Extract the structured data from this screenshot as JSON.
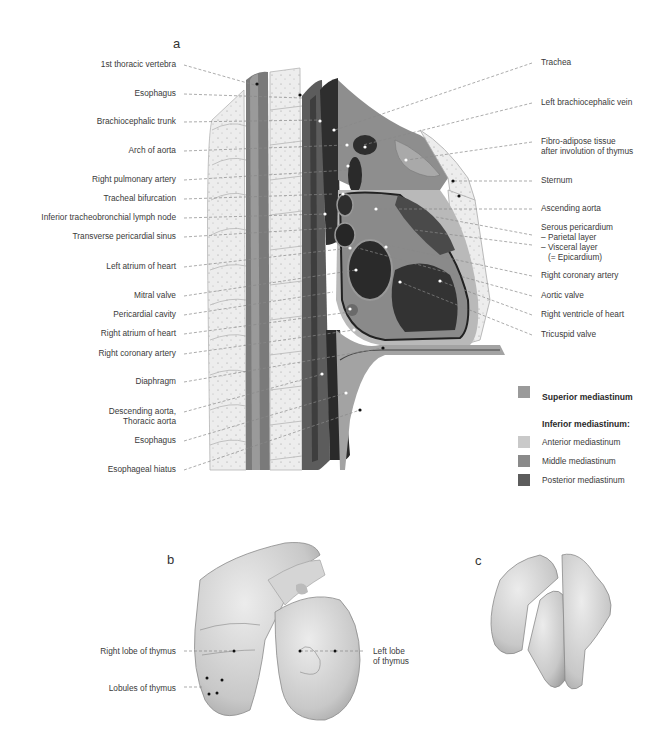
{
  "figure": {
    "panel_a_letter": "a",
    "panel_b_letter": "b",
    "panel_c_letter": "c"
  },
  "panel_a": {
    "left_labels": [
      {
        "text": "1st thoracic vertebra",
        "y": 62
      },
      {
        "text": "Esophagus",
        "y": 91
      },
      {
        "text": "Brachiocephalic trunk",
        "y": 119
      },
      {
        "text": "Arch of aorta",
        "y": 148
      },
      {
        "text": "Right pulmonary artery",
        "y": 177
      },
      {
        "text": "Tracheal bifurcation",
        "y": 196
      },
      {
        "text": "Inferior tracheobronchial lymph node",
        "y": 215
      },
      {
        "text": "Transverse pericardial sinus",
        "y": 234
      },
      {
        "text": "Left atrium of heart",
        "y": 264
      },
      {
        "text": "Mitral valve",
        "y": 293
      },
      {
        "text": "Pericardial cavity",
        "y": 312
      },
      {
        "text": "Right atrium of heart",
        "y": 331
      },
      {
        "text": "Right coronary artery",
        "y": 351
      },
      {
        "text": "Diaphragm",
        "y": 379
      },
      {
        "text": "Descending aorta,\nThoracic aorta",
        "y": 409
      },
      {
        "text": "Esophagus",
        "y": 438
      },
      {
        "text": "Esophageal hiatus",
        "y": 467
      }
    ],
    "right_labels": [
      {
        "text": "Trachea",
        "y": 60
      },
      {
        "text": "Left brachiocephalic vein",
        "y": 100
      },
      {
        "text": "Fibro-adipose tissue\nafter involution of thymus",
        "y": 139
      },
      {
        "text": "Sternum",
        "y": 178
      },
      {
        "text": "Ascending aorta",
        "y": 206
      },
      {
        "text": "Serous pericardium\n– Parietal layer\n– Visceral layer\n   (= Epicardium)",
        "y": 225
      },
      {
        "text": "Right coronary artery",
        "y": 273
      },
      {
        "text": "Aortic valve",
        "y": 293
      },
      {
        "text": "Right ventricle of heart",
        "y": 312
      },
      {
        "text": "Tricuspid valve",
        "y": 332
      }
    ],
    "legend": {
      "superior_label": "Superior mediastinum",
      "inferior_title": "Inferior mediastinum:",
      "items": [
        {
          "label": "Anterior mediastinum",
          "color": "#c9c9c9"
        },
        {
          "label": "Middle mediastinum",
          "color": "#8a8a8a"
        },
        {
          "label": "Posterior mediastinum",
          "color": "#5c5c5c"
        }
      ],
      "superior_color": "#9a9a9a"
    }
  },
  "panel_b": {
    "labels": {
      "right_lobe": "Right lobe of thymus",
      "lobules": "Lobules of thymus",
      "left_lobe": "Left lobe\nof thymus"
    }
  }
}
